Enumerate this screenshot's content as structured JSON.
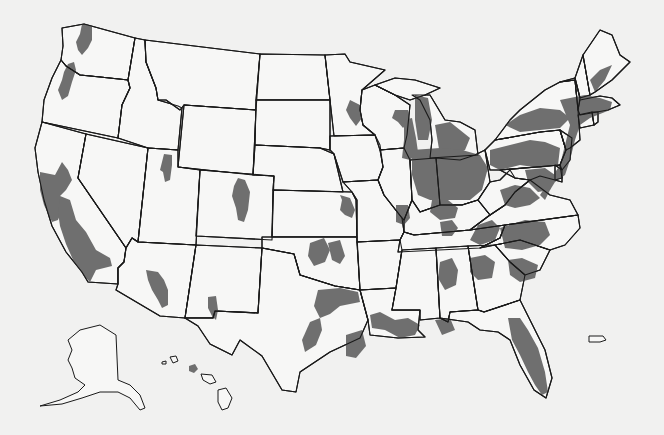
{
  "map": {
    "type": "choropleth-outline",
    "subject": "United States with shaded metropolitan areas",
    "colors": {
      "background": "#f1f1f0",
      "land": "#f7f7f6",
      "border": "#1a1a1a",
      "shaded": "#6f6f6f"
    },
    "legend": null,
    "labels": [],
    "states": [
      {
        "id": "WA",
        "d": "M62,28 L84,24 L135,38 L128,80 L100,77 L80,75 L66,66 L61,60 L63,46 Z"
      },
      {
        "id": "OR",
        "d": "M61,60 L66,66 L80,75 L100,77 L128,80 L130,88 L122,105 L118,138 L42,122 L44,100 L52,78 Z"
      },
      {
        "id": "CA",
        "d": "M42,122 L86,134 L78,178 L126,248 L124,262 L118,268 L118,284 L88,282 L82,272 L66,252 L52,226 L44,200 L38,172 L35,148 Z"
      },
      {
        "id": "NV",
        "d": "M86,134 L148,148 L138,242 L132,238 L126,248 L78,178 Z"
      },
      {
        "id": "ID",
        "d": "M135,38 L145,40 L146,62 L156,88 L158,100 L178,106 L182,108 L178,150 L148,148 L118,138 L122,105 L130,88 L128,80 Z"
      },
      {
        "id": "MT",
        "d": "M145,40 L260,54 L256,110 L184,105 L180,110 L166,100 L158,100 L156,88 L146,62 Z"
      },
      {
        "id": "WY",
        "d": "M184,105 L256,110 L253,175 L178,167 Z"
      },
      {
        "id": "UT",
        "d": "M148,148 L178,150 L178,167 L200,170 L196,245 L138,242 Z"
      },
      {
        "id": "CO",
        "d": "M200,170 L274,176 L272,240 L196,236 Z"
      },
      {
        "id": "AZ",
        "d": "M138,242 L196,245 L185,318 L160,316 L116,290 L118,284 L118,268 L124,262 L126,248 L132,238 Z"
      },
      {
        "id": "NM",
        "d": "M196,245 L262,248 L258,313 L215,311 L213,318 L185,318 Z"
      },
      {
        "id": "ND",
        "d": "M260,54 L325,55 L330,100 L256,100 Z"
      },
      {
        "id": "SD",
        "d": "M256,100 L330,100 L330,150 L320,148 L255,145 Z"
      },
      {
        "id": "NE",
        "d": "M255,145 L320,148 L334,154 L343,192 L273,190 L274,176 L253,175 Z"
      },
      {
        "id": "KS",
        "d": "M273,190 L352,192 L356,200 L357,237 L272,237 Z"
      },
      {
        "id": "OK",
        "d": "M262,237 L357,237 L360,290 L335,286 L300,275 L294,254 L262,248 Z"
      },
      {
        "id": "TX",
        "d": "M262,248 L294,254 L300,275 L335,286 L360,290 L368,320 L360,338 L330,352 L300,372 L296,392 L282,390 L262,356 L240,340 L232,355 L210,344 L198,326 L185,318 L213,318 L215,311 L258,313 Z"
      },
      {
        "id": "MN",
        "d": "M325,55 L345,54 L350,62 L385,70 L362,90 L360,110 L363,125 L375,135 L334,136 L330,100 Z"
      },
      {
        "id": "IA",
        "d": "M330,136 L375,135 L380,145 L383,167 L378,180 L343,182 L334,154 L330,150 Z"
      },
      {
        "id": "MO",
        "d": "M343,182 L378,180 L384,195 L402,218 L404,232 L400,240 L357,242 L357,200 L352,192 Z"
      },
      {
        "id": "AR",
        "d": "M357,242 L400,240 L402,250 L396,288 L360,290 Z"
      },
      {
        "id": "LA",
        "d": "M360,290 L396,288 L392,310 L420,310 L418,330 L425,337 L398,338 L370,335 L368,320 Z"
      },
      {
        "id": "WI",
        "d": "M362,90 L375,85 L395,95 L410,105 L407,135 L404,148 L380,150 L375,135 L363,125 L360,110 Z"
      },
      {
        "id": "IL",
        "d": "M380,150 L404,148 L410,160 L412,200 L404,220 L402,218 L384,195 L378,180 L383,167 Z"
      },
      {
        "id": "MI",
        "d": "M412,95 L430,95 L445,120 L460,122 L475,130 L478,155 L430,158 L432,140 L430,120 L420,100 Z"
      },
      {
        "id": "MIU",
        "d": "M375,85 L395,78 L415,80 L440,88 L425,95 L410,100 L395,95 Z"
      },
      {
        "id": "IN",
        "d": "M410,160 L436,158 L440,205 L420,212 L412,200 Z"
      },
      {
        "id": "OH",
        "d": "M436,158 L460,160 L475,155 L485,150 L490,182 L478,200 L462,205 L440,205 Z"
      },
      {
        "id": "KY",
        "d": "M404,220 L412,200 L420,212 L440,205 L462,205 L478,200 L490,215 L470,230 L414,235 L404,232 Z"
      },
      {
        "id": "TN",
        "d": "M400,240 L404,232 L414,235 L470,230 L505,225 L500,238 L480,248 L398,252 Z"
      },
      {
        "id": "MS",
        "d": "M402,250 L436,248 L440,318 L420,320 L420,310 L392,310 L396,288 Z"
      },
      {
        "id": "AL",
        "d": "M436,248 L468,246 L478,310 L450,312 L448,322 L440,318 Z"
      },
      {
        "id": "GA",
        "d": "M468,246 L495,245 L510,262 L525,275 L520,300 L484,312 L478,310 Z"
      },
      {
        "id": "FL",
        "d": "M440,318 L448,322 L450,312 L478,310 L484,312 L520,300 L530,320 L545,350 L552,378 L546,398 L534,390 L520,365 L510,340 L498,332 L480,330 L468,322 Z"
      },
      {
        "id": "SC",
        "d": "M495,245 L520,240 L550,250 L540,270 L525,275 L510,262 Z"
      },
      {
        "id": "NC",
        "d": "M480,248 L500,238 L505,225 L578,215 L580,228 L565,245 L550,250 L520,240 L495,245 Z"
      },
      {
        "id": "VA",
        "d": "M490,215 L505,205 L515,192 L530,180 L550,195 L570,200 L578,215 L505,225 L470,230 Z"
      },
      {
        "id": "WV",
        "d": "M478,200 L490,182 L500,180 L510,170 L515,178 L530,180 L515,192 L505,205 L490,215 Z"
      },
      {
        "id": "PA",
        "d": "M485,150 L495,140 L540,132 L560,130 L566,150 L560,165 L500,170 L490,170 Z"
      },
      {
        "id": "NY",
        "d": "M495,140 L510,120 L520,110 L545,90 L560,82 L575,80 L578,110 L580,140 L570,148 L566,150 L560,130 L540,132 Z"
      },
      {
        "id": "NJ",
        "d": "M560,130 L572,138 L570,160 L562,170 L560,165 L566,150 Z"
      },
      {
        "id": "MD",
        "d": "M500,170 L560,165 L562,178 L555,180 L540,176 L530,180 L515,178 Z"
      },
      {
        "id": "DE",
        "d": "M555,165 L562,170 L562,182 L555,180 Z"
      },
      {
        "id": "VT",
        "d": "M560,82 L575,78 L580,98 L578,110 L575,80 Z"
      },
      {
        "id": "NH",
        "d": "M575,78 L583,55 L590,95 L580,98 Z"
      },
      {
        "id": "ME",
        "d": "M583,55 L600,30 L612,35 L620,55 L630,62 L612,80 L595,92 L590,95 Z"
      },
      {
        "id": "MA",
        "d": "M578,110 L580,100 L600,96 L612,98 L620,105 L608,110 L580,115 Z"
      },
      {
        "id": "CT",
        "d": "M578,115 L592,112 L594,125 L580,128 Z"
      },
      {
        "id": "RI",
        "d": "M592,112 L598,112 L598,122 L594,125 Z"
      }
    ],
    "metros": [
      {
        "name": "Seattle",
        "d": "M82,24 L92,26 L92,40 L88,48 L82,55 L78,50 L76,42 L80,34 Z"
      },
      {
        "name": "Portland",
        "d": "M68,64 L74,62 L76,70 L72,82 L68,96 L62,100 L58,90 L62,80 L64,72 Z"
      },
      {
        "name": "San Francisco Bay",
        "d": "M40,172 L55,175 L62,162 L68,170 L72,180 L66,190 L60,196 L62,210 L58,220 L52,222 L44,205 L40,190 Z"
      },
      {
        "name": "Central Valley",
        "d": "M60,196 L70,200 L76,220 L86,232 L96,250 L110,258 L112,266 L96,270 L90,282 L84,276 L74,262 L66,244 L60,226 L58,212 Z"
      },
      {
        "name": "Salt Lake City",
        "d": "M164,154 L172,155 L172,165 L170,180 L165,182 L163,172 L160,170 Z"
      },
      {
        "name": "Denver",
        "d": "M238,178 L245,180 L250,192 L248,210 L244,222 L238,220 L236,208 L232,196 L234,186 Z"
      },
      {
        "name": "Phoenix",
        "d": "M146,270 L158,272 L164,280 L168,290 L168,305 L162,308 L158,300 L152,290 L148,280 Z"
      },
      {
        "name": "El Paso",
        "d": "M208,297 L216,296 L218,310 L216,320 L212,316 L208,308 Z"
      },
      {
        "name": "Minneapolis",
        "d": "M350,100 L360,105 L362,118 L356,126 L350,118 L346,110 Z"
      },
      {
        "name": "Milwaukee",
        "d": "M395,110 L408,110 L410,120 L403,128 L398,122 L392,118 Z"
      },
      {
        "name": "Chicago",
        "d": "M404,120 L412,118 L416,138 L418,152 L410,160 L402,158 L404,140 Z"
      },
      {
        "name": "Kansas City",
        "d": "M340,195 L350,198 L355,210 L352,218 L345,215 L340,210 L342,200 Z"
      },
      {
        "name": "St Louis",
        "d": "M396,205 L408,205 L410,218 L404,225 L396,222 Z"
      },
      {
        "name": "Oklahoma City",
        "d": "M310,243 L324,238 L330,250 L325,262 L314,266 L308,256 Z"
      },
      {
        "name": "Tulsa",
        "d": "M328,243 L340,240 L345,256 L340,264 L332,260 Z"
      },
      {
        "name": "Dallas Fort Worth",
        "d": "M318,290 L340,288 L358,292 L360,302 L340,306 L330,314 L320,318 L314,306 Z"
      },
      {
        "name": "Austin San Antonio",
        "d": "M310,322 L320,318 L322,330 L316,345 L305,352 L302,340 Z"
      },
      {
        "name": "Houston",
        "d": "M346,335 L362,330 L366,346 L356,358 L346,356 Z"
      },
      {
        "name": "Shreveport Baton Rouge",
        "d": "M370,315 L380,312 L395,320 L408,318 L420,325 L415,335 L400,338 L385,330 L372,328 Z"
      },
      {
        "name": "Detroit Michigan",
        "d": "M435,125 L450,122 L460,130 L470,138 L465,150 L450,158 L440,155 Z"
      },
      {
        "name": "Grand Rapids",
        "d": "M415,95 L428,98 L432,120 L428,140 L418,140 L415,120 Z"
      },
      {
        "name": "Indiana Ohio belt",
        "d": "M412,150 L440,148 L462,150 L480,155 L488,168 L482,190 L470,200 L450,200 L430,200 L418,195 L412,175 Z"
      },
      {
        "name": "Pennsylvania",
        "d": "M490,150 L510,145 L530,140 L545,142 L560,148 L558,165 L540,168 L520,165 L500,170 L490,165 Z"
      },
      {
        "name": "New York upstate",
        "d": "M505,125 L520,115 L540,108 L560,110 L570,118 L560,128 L540,130 L520,132 Z"
      },
      {
        "name": "Northeast corridor",
        "d": "M560,100 L585,95 L600,98 L612,102 L610,110 L590,118 L580,125 L575,140 L570,160 L565,175 L555,182 L550,190 L545,200 L540,195 L550,180 L560,165 L565,145 L570,125 Z"
      },
      {
        "name": "Maine coast",
        "d": "M590,80 L600,70 L612,65 L605,80 L595,92 Z"
      },
      {
        "name": "Baltimore Washington",
        "d": "M525,170 L545,168 L555,175 L550,190 L538,192 L528,182 Z"
      },
      {
        "name": "Virginia",
        "d": "M500,190 L515,185 L530,188 L540,198 L530,205 L515,208 L505,205 Z"
      },
      {
        "name": "Louisville Cincinnati",
        "d": "M432,200 L448,200 L458,208 L455,218 L440,220 L430,212 Z"
      },
      {
        "name": "Nashville",
        "d": "M440,222 L452,220 L458,228 L452,236 L442,236 Z"
      },
      {
        "name": "Knoxville Chattanooga",
        "d": "M478,225 L492,220 L500,228 L495,240 L480,245 L470,240 Z"
      },
      {
        "name": "Carolinas Piedmont",
        "d": "M500,228 L525,220 L545,222 L550,235 L540,245 L522,250 L505,248 Z"
      },
      {
        "name": "Birmingham",
        "d": "M440,262 L452,258 L458,270 L456,285 L445,290 L438,278 Z"
      },
      {
        "name": "Atlanta",
        "d": "M470,258 L485,255 L495,262 L492,278 L478,280 L470,272 Z"
      },
      {
        "name": "SC Charleston Columbia",
        "d": "M508,260 L522,258 L538,265 L535,278 L520,282 L510,275 Z"
      },
      {
        "name": "Gulf coast AL MS",
        "d": "M435,320 L450,318 L455,330 L442,335 Z"
      },
      {
        "name": "Florida",
        "d": "M508,318 L520,318 L528,330 L538,348 L545,372 L548,392 L542,395 L535,385 L528,372 L520,355 L512,340 Z"
      },
      {
        "name": "Honolulu",
        "d": "M189,366 L195,364 L198,369 L194,373 L189,371 Z"
      }
    ],
    "islands": [
      {
        "name": "Alaska",
        "d": "M80,330 L100,325 L116,335 L118,380 L130,385 L140,395 L145,408 L140,410 L130,398 L118,392 L100,392 L82,398 L62,404 L40,406 L60,400 L78,392 L85,385 L75,378 L72,368 L68,360 L72,350 L68,340 Z"
      },
      {
        "name": "Hawaii big island",
        "d": "M218,390 L226,388 L232,398 L228,408 L222,410 L218,402 Z"
      },
      {
        "name": "Maui Molokai",
        "d": "M201,374 L212,375 L216,382 L210,384 L203,380 Z"
      },
      {
        "name": "Kauai",
        "d": "M170,357 L176,356 L178,361 L173,363 Z"
      },
      {
        "name": "Niihau",
        "d": "M162,362 L166,361 L166,364 L162,364 Z"
      },
      {
        "name": "Puerto Rico",
        "d": "M589,336 L603,336 L606,340 L600,342 L589,342 Z"
      }
    ]
  }
}
